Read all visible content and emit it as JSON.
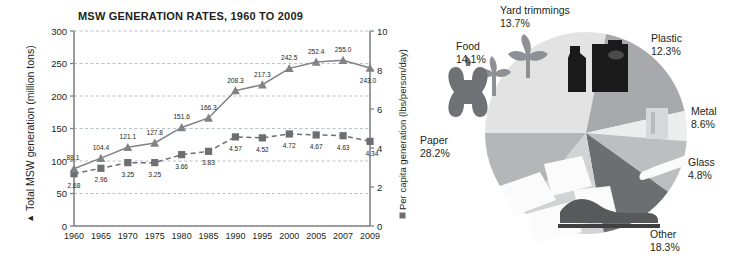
{
  "chart_data": [
    {
      "type": "line",
      "title": "MSW GENERATION RATES, 1960 TO 2009",
      "xlabel": "",
      "ylabel": "▲ Total MSW generation (million tons)",
      "y2label": "Per capita generation (lbs/person/day)",
      "y2label_marker": "square",
      "grid": true,
      "legend": "axis-labels",
      "categories": [
        "1960",
        "1965",
        "1970",
        "1975",
        "1980",
        "1985",
        "1990",
        "1995",
        "2000",
        "2005",
        "2007",
        "2009"
      ],
      "ylim": [
        0,
        300
      ],
      "yticks": [
        "0",
        "50",
        "100",
        "150",
        "200",
        "250",
        "300"
      ],
      "y2lim": [
        0,
        10
      ],
      "y2ticks": [
        "0",
        "2",
        "4",
        "6",
        "8",
        "10"
      ],
      "series": [
        {
          "name": "Total MSW generation (million tons)",
          "marker": "triangle",
          "axis": "left",
          "linestyle": "solid",
          "color": "#808285",
          "values": [
            88.1,
            104.4,
            121.1,
            127.8,
            151.6,
            166.3,
            208.3,
            217.3,
            242.5,
            252.4,
            255.0,
            243.0
          ],
          "labels": [
            "88.1",
            "104.4",
            "121.1",
            "127.8",
            "151.6",
            "166.3",
            "208.3",
            "217.3",
            "242.5",
            "252.4",
            "255.0",
            "243.0"
          ]
        },
        {
          "name": "Per capita generation (lbs/person/day)",
          "marker": "square",
          "axis": "right",
          "linestyle": "dashed",
          "color": "#6d6e71",
          "values": [
            2.68,
            2.96,
            3.25,
            3.25,
            3.66,
            3.83,
            4.57,
            4.52,
            4.72,
            4.67,
            4.63,
            4.34
          ],
          "labels": [
            "2.68",
            "2.96",
            "3.25",
            "3.25",
            "3.66",
            "3.83",
            "4.57",
            "4.52",
            "4.72",
            "4.67",
            "4.63",
            "4.34"
          ]
        }
      ]
    },
    {
      "type": "pie",
      "title": "",
      "legend": "outside-labels",
      "categories": [
        "Paper",
        "Other",
        "Glass",
        "Metal",
        "Plastic",
        "Yard trimmings",
        "Food"
      ],
      "values": [
        28.2,
        18.3,
        4.8,
        8.6,
        12.3,
        13.7,
        14.1
      ],
      "labels": [
        "28.2%",
        "18.3%",
        "4.8%",
        "8.6%",
        "12.3%",
        "13.7%",
        "14.1%"
      ],
      "slice_colors": [
        "#e3e3e3",
        "#a8a9ad",
        "#eceded",
        "#bcbec0",
        "#6d6e71",
        "#d1d3d4",
        "#b4b6b8"
      ],
      "slice_icons": [
        "paper-sheets-icon",
        "shoe-icon",
        "glass-bottle-icon",
        "metal-can-icon",
        "plastic-bottles-icon",
        "leaves-icon",
        "apple-core-icon"
      ]
    }
  ],
  "line_chart": {
    "title": "MSW GENERATION RATES, 1960 TO 2009",
    "y_left_axis_label": "Total MSW generation (million tons)",
    "y_right_axis_label": "Per capita generation (lbs/person/day)"
  },
  "pie_chart": {
    "slices": [
      {
        "name": "Yard trimmings",
        "label": "Yard trimmings",
        "pct": "13.7%"
      },
      {
        "name": "Food",
        "label": "Food",
        "pct": "14.1%"
      },
      {
        "name": "Paper",
        "label": "Paper",
        "pct": "28.2%"
      },
      {
        "name": "Plastic",
        "label": "Plastic",
        "pct": "12.3%"
      },
      {
        "name": "Metal",
        "label": "Metal",
        "pct": "8.6%"
      },
      {
        "name": "Glass",
        "label": "Glass",
        "pct": "4.8%"
      },
      {
        "name": "Other",
        "label": "Other",
        "pct": "18.3%"
      }
    ]
  }
}
